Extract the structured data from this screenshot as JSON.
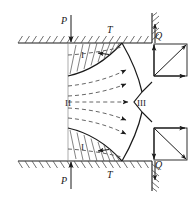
{
  "figure": {
    "colors": {
      "line": "#1a1a1a",
      "hatch": "#4d4d4d",
      "dashed_flow": "#555555",
      "background": "#ffffff"
    },
    "labels": {
      "load_top": "P",
      "load_bottom": "P",
      "friction_top": "T",
      "friction_bottom": "T",
      "reaction_top": "Q",
      "reaction_bottom": "Q",
      "zone_one_top": "I",
      "zone_one_bottom": "I",
      "zone_two": "II",
      "zone_three": "III"
    },
    "zones": [
      {
        "id": "I",
        "name": "dead-metal-zone-top",
        "label": "I"
      },
      {
        "id": "I",
        "name": "dead-metal-zone-bottom",
        "label": "I"
      },
      {
        "id": "II",
        "name": "plastic-flow-zone",
        "label": "II"
      },
      {
        "id": "III",
        "name": "exit-zone",
        "label": "III"
      }
    ],
    "forces": [
      {
        "name": "applied-load-top",
        "symbol": "P",
        "direction": "down"
      },
      {
        "name": "applied-load-bottom",
        "symbol": "P",
        "direction": "up"
      },
      {
        "name": "friction-force-top",
        "symbol": "T",
        "direction": "none"
      },
      {
        "name": "friction-force-bottom",
        "symbol": "T",
        "direction": "none"
      },
      {
        "name": "reaction-force-top",
        "symbol": "Q",
        "direction": "up"
      },
      {
        "name": "reaction-force-bottom",
        "symbol": "Q",
        "direction": "down"
      }
    ],
    "force_parallelograms": [
      {
        "name": "force-parallelogram-top",
        "components": [
          "vertical-up",
          "horizontal-right",
          "resultant-diagonal"
        ]
      },
      {
        "name": "force-parallelogram-bottom",
        "components": [
          "vertical-down",
          "horizontal-right",
          "resultant-diagonal"
        ]
      }
    ],
    "flow_lines": {
      "name": "streamlines",
      "count": 6,
      "style": "dashed-with-arrowhead"
    }
  }
}
